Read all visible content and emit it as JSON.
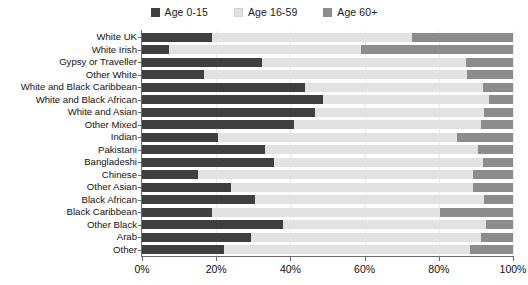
{
  "chart": {
    "type": "bar",
    "title": "",
    "legend_position": "top-center"
  },
  "legend": {
    "items": [
      {
        "label": "Age 0-15",
        "color": "#3f3f3f",
        "icon": "legend-swatch-icon"
      },
      {
        "label": "Age 16-59",
        "color": "#e2e2e2",
        "icon": "legend-swatch-icon"
      },
      {
        "label": "Age 60+",
        "color": "#8c8c8c",
        "icon": "legend-swatch-icon"
      }
    ]
  },
  "axes": {
    "x": {
      "ticks": [
        "0%",
        "20%",
        "40%",
        "60%",
        "80%",
        "100%"
      ],
      "values": [
        0,
        20,
        40,
        60,
        80,
        100
      ],
      "min": 0,
      "max": 100,
      "label": ""
    },
    "y": {
      "label": ""
    }
  },
  "chart_data": {
    "type": "bar",
    "orientation": "horizontal",
    "stacked": true,
    "stack_total": 100,
    "title": "",
    "xlabel": "",
    "ylabel": "",
    "xlim": [
      0,
      100
    ],
    "grid": true,
    "legend_position": "top-center",
    "xtick_labels": [
      "0%",
      "20%",
      "40%",
      "60%",
      "80%",
      "100%"
    ],
    "categories": [
      "White UK",
      "White Irish",
      "Gypsy or Traveller",
      "Other White",
      "White and Black Caribbean",
      "White and Black African",
      "White and Asian",
      "Other Mixed",
      "Indian",
      "Pakistani",
      "Bangladeshi",
      "Chinese",
      "Other Asian",
      "Black African",
      "Black Caribbean",
      "Other Black",
      "Arab",
      "Other"
    ],
    "series": [
      {
        "name": "Age 0-15",
        "color": "#3f3f3f",
        "values": [
          18.9,
          7.2,
          32.3,
          16.7,
          43.9,
          48.7,
          46.5,
          41.0,
          20.4,
          33.2,
          35.5,
          15.1,
          23.9,
          30.5,
          18.9,
          37.9,
          29.4,
          22.0
        ]
      },
      {
        "name": "Age 16-59",
        "color": "#e2e2e2",
        "values": [
          53.9,
          51.9,
          54.9,
          70.9,
          48.0,
          44.7,
          45.6,
          50.4,
          64.5,
          57.4,
          56.4,
          74.2,
          65.4,
          61.8,
          61.4,
          54.7,
          61.9,
          66.4
        ]
      },
      {
        "name": "Age 60+",
        "color": "#8c8c8c",
        "values": [
          27.2,
          40.9,
          12.8,
          12.4,
          8.1,
          6.6,
          7.9,
          8.6,
          15.1,
          9.4,
          8.1,
          10.7,
          10.7,
          7.7,
          19.7,
          7.4,
          8.7,
          11.6
        ]
      }
    ],
    "rows": [
      {
        "category": "White UK",
        "age_0_15": 18.9,
        "age_16_59": 53.9,
        "age_60_plus": 27.2
      },
      {
        "category": "White Irish",
        "age_0_15": 7.2,
        "age_16_59": 51.9,
        "age_60_plus": 40.9
      },
      {
        "category": "Gypsy or Traveller",
        "age_0_15": 32.3,
        "age_16_59": 54.9,
        "age_60_plus": 12.8
      },
      {
        "category": "Other White",
        "age_0_15": 16.7,
        "age_16_59": 70.9,
        "age_60_plus": 12.4
      },
      {
        "category": "White and Black Caribbean",
        "age_0_15": 43.9,
        "age_16_59": 48.0,
        "age_60_plus": 8.1
      },
      {
        "category": "White and Black African",
        "age_0_15": 48.7,
        "age_16_59": 44.7,
        "age_60_plus": 6.6
      },
      {
        "category": "White and Asian",
        "age_0_15": 46.5,
        "age_16_59": 45.6,
        "age_60_plus": 7.9
      },
      {
        "category": "Other Mixed",
        "age_0_15": 41.0,
        "age_16_59": 50.4,
        "age_60_plus": 8.6
      },
      {
        "category": "Indian",
        "age_0_15": 20.4,
        "age_16_59": 64.5,
        "age_60_plus": 15.1
      },
      {
        "category": "Pakistani",
        "age_0_15": 33.2,
        "age_16_59": 57.4,
        "age_60_plus": 9.4
      },
      {
        "category": "Bangladeshi",
        "age_0_15": 35.5,
        "age_16_59": 56.4,
        "age_60_plus": 8.1
      },
      {
        "category": "Chinese",
        "age_0_15": 15.1,
        "age_16_59": 74.2,
        "age_60_plus": 10.7
      },
      {
        "category": "Other Asian",
        "age_0_15": 23.9,
        "age_16_59": 65.4,
        "age_60_plus": 10.7
      },
      {
        "category": "Black African",
        "age_0_15": 30.5,
        "age_16_59": 61.8,
        "age_60_plus": 7.7
      },
      {
        "category": "Black Caribbean",
        "age_0_15": 18.9,
        "age_16_59": 61.4,
        "age_60_plus": 19.7
      },
      {
        "category": "Other Black",
        "age_0_15": 37.9,
        "age_16_59": 54.7,
        "age_60_plus": 7.4
      },
      {
        "category": "Arab",
        "age_0_15": 29.4,
        "age_16_59": 61.9,
        "age_60_plus": 8.7
      },
      {
        "category": "Other",
        "age_0_15": 22.0,
        "age_16_59": 66.4,
        "age_60_plus": 11.6
      }
    ]
  }
}
